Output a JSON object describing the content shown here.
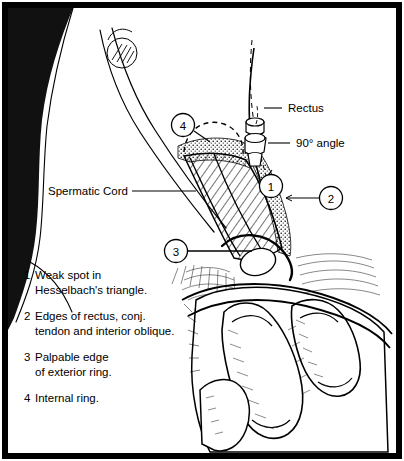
{
  "figure": {
    "type": "line-art-medical-illustration",
    "style": "black-and-white pen-and-ink drawing with hatching, stippling and a solid black body silhouette, enclosed in a thick black rectangular frame",
    "frame": {
      "border_color": "#000000",
      "background": "#ffffff"
    }
  },
  "callouts": [
    {
      "id": "rectus",
      "text": "Rectus",
      "leader": "dashed line to rectus muscle edge"
    },
    {
      "id": "angle",
      "text": "90° angle",
      "leader": "solid line to cord/ring junction"
    },
    {
      "id": "cord",
      "text": "Spermatic Cord",
      "leader": "solid horizontal line to hatched cord"
    }
  ],
  "markers": [
    {
      "id": "marker-1",
      "label": "1",
      "meaning": "Weak spot in Hesselbach's triangle."
    },
    {
      "id": "marker-2",
      "label": "2",
      "meaning": "Edges of rectus, conj. tendon and interior oblique."
    },
    {
      "id": "marker-3",
      "label": "3",
      "meaning": "Palpable edge of exterior ring."
    },
    {
      "id": "marker-4",
      "label": "4",
      "meaning": "Internal ring."
    }
  ],
  "legend": [
    {
      "num": "1",
      "text": "Weak spot in\nHesselbach's triangle."
    },
    {
      "num": "2",
      "text": "Edges of rectus, conj.\ntendon and interior oblique."
    },
    {
      "num": "3",
      "text": "Palpable edge\nof exterior ring."
    },
    {
      "num": "4",
      "text": "Internal ring."
    }
  ],
  "colors": {
    "ink": "#000000",
    "paper": "#ffffff",
    "silhouette": "#111111"
  }
}
